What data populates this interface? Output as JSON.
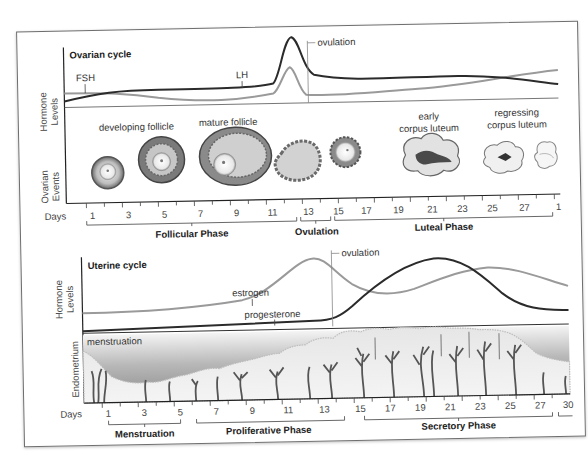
{
  "ovarian": {
    "title": "Ovarian cycle",
    "hormone_axis": [
      "Hormone",
      "Levels"
    ],
    "events_axis": [
      "Ovarian",
      "Events"
    ],
    "fsh_label": "FSH",
    "lh_label": "LH",
    "ovulation_label": "ovulation",
    "event_labels": {
      "developing": "developing follicle",
      "mature": "mature follicle",
      "early_cl_1": "early",
      "early_cl_2": "corpus luteum",
      "regress_1": "regressing",
      "regress_2": "corpus luteum"
    },
    "days_label": "Days",
    "days": [
      "1",
      "3",
      "5",
      "7",
      "9",
      "11",
      "13",
      "15",
      "17",
      "19",
      "21",
      "23",
      "25",
      "27",
      "1"
    ],
    "phases": {
      "follicular": "Follicular Phase",
      "ovulation": "Ovulation",
      "luteal": "Luteal Phase"
    }
  },
  "uterine": {
    "title": "Uterine cycle",
    "hormone_axis": [
      "Hormone",
      "Levels"
    ],
    "endometrium_axis": "Endometrium",
    "estrogen_label": "estrogen",
    "progesterone_label": "progesterone",
    "ovulation_label": "ovulation",
    "menstruation_label": "menstruation",
    "days_label": "Days",
    "days": [
      "1",
      "3",
      "5",
      "7",
      "9",
      "11",
      "13",
      "15",
      "17",
      "19",
      "21",
      "23",
      "25",
      "27",
      "30"
    ],
    "phases": {
      "menstruation": "Menstruation",
      "proliferative": "Proliferative Phase",
      "secretory": "Secretory Phase"
    }
  },
  "colors": {
    "dark_line": "#2b2b2b",
    "light_line": "#9a9a9a",
    "frame": "#6e6e6e"
  }
}
